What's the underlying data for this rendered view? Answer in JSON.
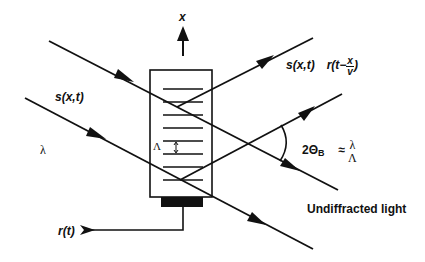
{
  "diagram": {
    "labels": {
      "axis_x": "x",
      "incident_signal": "s(x,t)",
      "wavelength": "λ",
      "grating_period": "Λ",
      "diffracted_signal": "s(x,t)",
      "diffracted_mod_prefix": "r(t−",
      "diffracted_mod_num": "x",
      "diffracted_mod_den": "v",
      "diffracted_mod_suffix": ")",
      "bragg_angle_prefix": "2Θ",
      "bragg_angle_sub": "B",
      "approx": "≈",
      "ratio_num": "λ",
      "ratio_den": "Λ",
      "undiffracted": "Undiffracted light",
      "rf_input": "r(t)"
    },
    "colors": {
      "ink": "#111111",
      "background": "#ffffff"
    }
  }
}
